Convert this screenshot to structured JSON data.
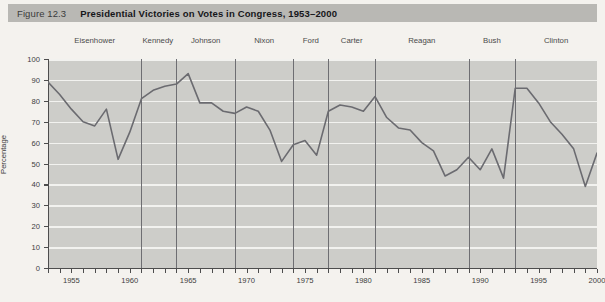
{
  "figure": {
    "number": "Figure 12.3",
    "title": "Presidential Victories on Votes in Congress, 1953–2000"
  },
  "colors": {
    "title_band": "#b9b8b4",
    "plot_background": "#cdcdc9",
    "gridline": "#f2f2ef",
    "series_line": "#6b6b70",
    "divider_line": "#6e6e72",
    "axis": "#4d4d4d",
    "page_background": "#f4f2ee"
  },
  "presidents": [
    {
      "name": "Eisenhower",
      "start": 1953,
      "end": 1961,
      "label_year": 1957
    },
    {
      "name": "Kennedy",
      "start": 1961,
      "end": 1964,
      "label_year": 1962.4
    },
    {
      "name": "Johnson",
      "start": 1964,
      "end": 1969,
      "label_year": 1966.5
    },
    {
      "name": "Nixon",
      "start": 1969,
      "end": 1974,
      "label_year": 1971.5
    },
    {
      "name": "Ford",
      "start": 1974,
      "end": 1977,
      "label_year": 1975.5
    },
    {
      "name": "Carter",
      "start": 1977,
      "end": 1981,
      "label_year": 1979
    },
    {
      "name": "Reagan",
      "start": 1981,
      "end": 1989,
      "label_year": 1985
    },
    {
      "name": "Bush",
      "start": 1989,
      "end": 1993,
      "label_year": 1991
    },
    {
      "name": "Clinton",
      "start": 1993,
      "end": 2001,
      "label_year": 1996.5
    }
  ],
  "dividers": [
    1961,
    1964,
    1969,
    1974,
    1977,
    1981,
    1989,
    1993
  ],
  "chart_data": {
    "type": "line",
    "title": "Presidential Victories on Votes in Congress, 1953–2000",
    "xlabel": "",
    "ylabel": "Percentage",
    "xlim": [
      1953,
      2000
    ],
    "ylim": [
      0,
      100
    ],
    "yticks": [
      0,
      10,
      20,
      30,
      40,
      50,
      60,
      70,
      80,
      90,
      100
    ],
    "xticks": [
      1955,
      1960,
      1965,
      1970,
      1975,
      1980,
      1985,
      1990,
      1995,
      2000
    ],
    "xtick_minor_step": 1,
    "grid": "horizontal",
    "legend": "none",
    "series": [
      {
        "name": "Presidential victories on votes in Congress",
        "x": [
          1953,
          1954,
          1955,
          1956,
          1957,
          1958,
          1959,
          1960,
          1961,
          1962,
          1963,
          1964,
          1965,
          1966,
          1967,
          1968,
          1969,
          1970,
          1971,
          1972,
          1973,
          1974,
          1975,
          1976,
          1977,
          1978,
          1979,
          1980,
          1981,
          1982,
          1983,
          1984,
          1985,
          1986,
          1987,
          1988,
          1989,
          1990,
          1991,
          1992,
          1993,
          1994,
          1995,
          1996,
          1997,
          1998,
          1999,
          2000
        ],
        "y": [
          89,
          83,
          76,
          70,
          68,
          76,
          52,
          65,
          81,
          85,
          87,
          88,
          93,
          79,
          79,
          75,
          74,
          77,
          75,
          66,
          51,
          59,
          61,
          54,
          75,
          78,
          77,
          75,
          82,
          72,
          67,
          66,
          60,
          56,
          44,
          47,
          53,
          47,
          57,
          43,
          86,
          86,
          79,
          70,
          64,
          57,
          39,
          55
        ]
      }
    ]
  }
}
